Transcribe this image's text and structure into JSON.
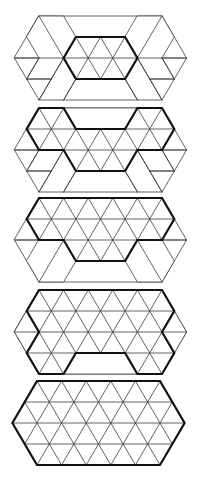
{
  "figure": {
    "title": "",
    "width": 208,
    "height": 478,
    "colors": {
      "background": "#ffffff",
      "line": "#3a3a3a",
      "bold": "#111111",
      "hatch": "#555555"
    },
    "lattice": {
      "x_origin": 14.4,
      "half_step": 12.3,
      "row_height": 21
    },
    "outer_hex": [
      [
        2,
        0
      ],
      [
        12,
        0
      ],
      [
        14,
        2
      ],
      [
        12,
        4
      ],
      [
        2,
        4
      ],
      [
        0,
        2
      ]
    ]
  },
  "panels": [
    {
      "id": "panel-1",
      "top": 16,
      "dx": 0,
      "lattice_region": [
        [
          5,
          1
        ],
        [
          9,
          1
        ],
        [
          10,
          2
        ],
        [
          9,
          3
        ],
        [
          5,
          3
        ],
        [
          4,
          2
        ]
      ],
      "bold": [
        [
          5,
          1
        ],
        [
          9,
          1
        ],
        [
          10,
          2
        ],
        [
          9,
          3
        ],
        [
          5,
          3
        ],
        [
          4,
          2
        ]
      ],
      "hatched": [
        {
          "poly": [
            [
              2,
              0
            ],
            [
              4,
              0
            ],
            [
              5,
              1
            ],
            [
              4,
              2
            ],
            [
              2,
              2
            ],
            [
              1,
              1
            ]
          ],
          "dir": "h"
        },
        {
          "poly": [
            [
              10,
              0
            ],
            [
              12,
              0
            ],
            [
              13,
              1
            ],
            [
              12,
              2
            ],
            [
              10,
              2
            ],
            [
              9,
              1
            ]
          ],
          "dir": "h"
        }
      ],
      "thin": [
        [
          [
            2,
            0
          ],
          [
            4,
            2
          ]
        ],
        [
          [
            12,
            0
          ],
          [
            10,
            2
          ]
        ],
        [
          [
            0,
            2
          ],
          [
            2,
            2
          ]
        ],
        [
          [
            12,
            2
          ],
          [
            14,
            2
          ]
        ],
        [
          [
            2,
            2
          ],
          [
            1,
            3
          ]
        ],
        [
          [
            1,
            3
          ],
          [
            3,
            3
          ]
        ],
        [
          [
            4,
            2
          ],
          [
            2,
            4
          ]
        ],
        [
          [
            5,
            3
          ],
          [
            4,
            4
          ]
        ],
        [
          [
            12,
            2
          ],
          [
            13,
            3
          ]
        ],
        [
          [
            13,
            3
          ],
          [
            11,
            3
          ]
        ],
        [
          [
            10,
            2
          ],
          [
            12,
            4
          ]
        ],
        [
          [
            9,
            3
          ],
          [
            10,
            4
          ]
        ],
        [
          [
            4,
            2
          ],
          [
            5,
            1
          ]
        ],
        [
          [
            10,
            2
          ],
          [
            9,
            1
          ]
        ]
      ]
    },
    {
      "id": "panel-2",
      "top": 108,
      "dx": 0,
      "lattice_region": [
        [
          2,
          0
        ],
        [
          4,
          0
        ],
        [
          5,
          1
        ],
        [
          9,
          1
        ],
        [
          10,
          0
        ],
        [
          12,
          0
        ],
        [
          13,
          1
        ],
        [
          12,
          2
        ],
        [
          10,
          2
        ],
        [
          9,
          3
        ],
        [
          5,
          3
        ],
        [
          4,
          2
        ],
        [
          2,
          2
        ],
        [
          1,
          1
        ]
      ],
      "bold": [
        [
          2,
          0
        ],
        [
          4,
          0
        ],
        [
          5,
          1
        ],
        [
          9,
          1
        ],
        [
          10,
          0
        ],
        [
          12,
          0
        ],
        [
          13,
          1
        ],
        [
          12,
          2
        ],
        [
          10,
          2
        ],
        [
          9,
          3
        ],
        [
          5,
          3
        ],
        [
          4,
          2
        ],
        [
          2,
          2
        ],
        [
          1,
          1
        ]
      ],
      "hatched": [
        {
          "poly": [
            [
              4,
              0
            ],
            [
              10,
              0
            ],
            [
              9,
              1
            ],
            [
              5,
              1
            ]
          ],
          "dir": "v"
        }
      ],
      "thin": [
        [
          [
            0,
            2
          ],
          [
            2,
            2
          ]
        ],
        [
          [
            12,
            2
          ],
          [
            14,
            2
          ]
        ],
        [
          [
            2,
            2
          ],
          [
            1,
            3
          ]
        ],
        [
          [
            1,
            3
          ],
          [
            3,
            3
          ]
        ],
        [
          [
            4,
            2
          ],
          [
            2,
            4
          ]
        ],
        [
          [
            5,
            3
          ],
          [
            4,
            4
          ]
        ],
        [
          [
            12,
            2
          ],
          [
            13,
            3
          ]
        ],
        [
          [
            13,
            3
          ],
          [
            11,
            3
          ]
        ],
        [
          [
            10,
            2
          ],
          [
            12,
            4
          ]
        ],
        [
          [
            9,
            3
          ],
          [
            10,
            4
          ]
        ]
      ]
    },
    {
      "id": "panel-3",
      "top": 198,
      "dx": 0,
      "lattice_region": [
        [
          2,
          0
        ],
        [
          12,
          0
        ],
        [
          13,
          1
        ],
        [
          12,
          2
        ],
        [
          10,
          2
        ],
        [
          9,
          3
        ],
        [
          5,
          3
        ],
        [
          4,
          2
        ],
        [
          2,
          2
        ],
        [
          1,
          1
        ]
      ],
      "bold": [
        [
          2,
          0
        ],
        [
          12,
          0
        ],
        [
          13,
          1
        ],
        [
          12,
          2
        ],
        [
          10,
          2
        ],
        [
          9,
          3
        ],
        [
          5,
          3
        ],
        [
          4,
          2
        ],
        [
          2,
          2
        ],
        [
          1,
          1
        ]
      ],
      "hatched": [
        {
          "poly": [
            [
              2,
              2
            ],
            [
              4,
              2
            ],
            [
              5,
              3
            ],
            [
              4,
              4
            ],
            [
              2,
              4
            ],
            [
              1,
              3
            ]
          ],
          "dir": "h"
        },
        {
          "poly": [
            [
              10,
              2
            ],
            [
              12,
              2
            ],
            [
              13,
              3
            ],
            [
              12,
              4
            ],
            [
              10,
              4
            ],
            [
              9,
              3
            ]
          ],
          "dir": "h"
        }
      ],
      "thin": [
        [
          [
            4,
            2
          ],
          [
            2,
            4
          ]
        ],
        [
          [
            10,
            2
          ],
          [
            12,
            4
          ]
        ],
        [
          [
            0,
            2
          ],
          [
            2,
            2
          ]
        ],
        [
          [
            12,
            2
          ],
          [
            14,
            2
          ]
        ]
      ]
    },
    {
      "id": "panel-4",
      "top": 290,
      "dx": 0,
      "lattice_region": [
        [
          2,
          0
        ],
        [
          12,
          0
        ],
        [
          13,
          1
        ],
        [
          12,
          2
        ],
        [
          13,
          3
        ],
        [
          12,
          4
        ],
        [
          10,
          4
        ],
        [
          9,
          3
        ],
        [
          5,
          3
        ],
        [
          4,
          4
        ],
        [
          2,
          4
        ],
        [
          1,
          3
        ],
        [
          2,
          2
        ],
        [
          1,
          1
        ]
      ],
      "bold": [
        [
          2,
          0
        ],
        [
          12,
          0
        ],
        [
          13,
          1
        ],
        [
          12,
          2
        ],
        [
          13,
          3
        ],
        [
          12,
          4
        ],
        [
          10,
          4
        ],
        [
          9,
          3
        ],
        [
          5,
          3
        ],
        [
          4,
          4
        ],
        [
          2,
          4
        ],
        [
          1,
          3
        ],
        [
          2,
          2
        ],
        [
          1,
          1
        ]
      ],
      "hatched": [
        {
          "poly": [
            [
              1,
              1
            ],
            [
              2,
              2
            ],
            [
              1,
              3
            ],
            [
              0,
              2
            ]
          ],
          "dir": "v"
        },
        {
          "poly": [
            [
              13,
              1
            ],
            [
              14,
              2
            ],
            [
              13,
              3
            ],
            [
              12,
              2
            ]
          ],
          "dir": "v"
        },
        {
          "poly": [
            [
              5,
              3
            ],
            [
              9,
              3
            ],
            [
              10,
              4
            ],
            [
              4,
              4
            ]
          ],
          "dir": "v"
        }
      ],
      "thin": [
        [
          [
            0,
            2
          ],
          [
            2,
            2
          ]
        ],
        [
          [
            12,
            2
          ],
          [
            14,
            2
          ]
        ]
      ]
    },
    {
      "id": "panel-5",
      "top": 381,
      "dx": -2,
      "lattice_region": [
        [
          2,
          0
        ],
        [
          12,
          0
        ],
        [
          14,
          2
        ],
        [
          12,
          4
        ],
        [
          2,
          4
        ],
        [
          0,
          2
        ]
      ],
      "bold": [
        [
          2,
          0
        ],
        [
          12,
          0
        ],
        [
          14,
          2
        ],
        [
          12,
          4
        ],
        [
          2,
          4
        ],
        [
          0,
          2
        ]
      ],
      "hatched": [],
      "thin": []
    }
  ]
}
